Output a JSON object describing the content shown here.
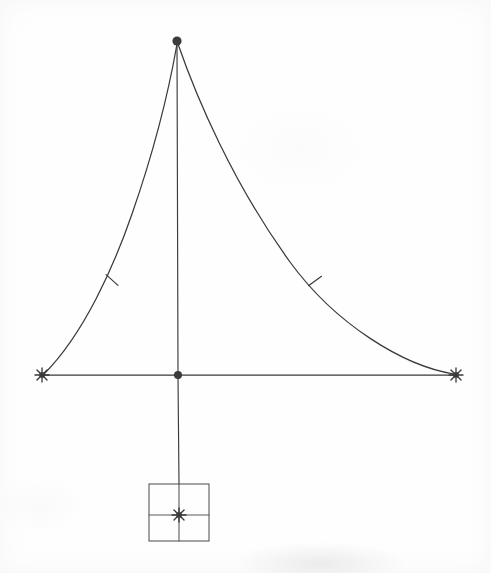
{
  "figure": {
    "background_color": "#fefefe",
    "ink_color": "#3a3a3c",
    "ink_color_light": "#5a5a5e",
    "width": 491,
    "height": 573
  },
  "geometry": {
    "apex": {
      "label": "apex-node",
      "x": 177,
      "y": 41,
      "marker": "filled-dot",
      "radius": 4.6
    },
    "center": {
      "label": "center-node",
      "x": 178,
      "y": 375,
      "marker": "filled-dot",
      "radius": 4.0
    },
    "left_end": {
      "label": "left-endpoint",
      "x": 42,
      "y": 375,
      "marker": "star-cross"
    },
    "right_end": {
      "label": "right-endpoint",
      "x": 456,
      "y": 375,
      "marker": "star-cross"
    },
    "left_tick": {
      "label": "left-curve-tick",
      "x": 112,
      "y": 280,
      "angle_deg": 42
    },
    "right_tick": {
      "label": "right-curve-tick",
      "x": 315,
      "y": 281,
      "angle_deg": -36
    },
    "box_center_marker": {
      "label": "box-center-node",
      "x": 179,
      "y": 515,
      "marker": "star-cross"
    }
  },
  "paths": {
    "left_curve": {
      "name": "left-curve",
      "description": "concave arc from apex down-left to left endpoint",
      "d": "M 177 44 C 170 84, 155 148, 132 214 C 114 266, 84 334, 44 374"
    },
    "right_curve": {
      "name": "right-curve",
      "description": "convex decay arc from apex down-right to right endpoint",
      "d": "M 178 44 C 196 96, 232 182, 290 262 C 336 325, 404 366, 454 374"
    },
    "vertical_axis_upper": {
      "name": "vertical-axis-upper",
      "description": "mast line from apex to center node",
      "d": "M 177 45 L 178 373"
    },
    "vertical_axis_lower": {
      "name": "vertical-axis-lower",
      "description": "stem line from center node down to base square",
      "d": "M 178 377 L 179 484"
    },
    "baseline": {
      "name": "baseline",
      "description": "horizontal base spanning left to right endpoint through center",
      "d": "M 43 375 L 455 375"
    }
  },
  "base_square": {
    "name": "base-square",
    "x": 149,
    "y": 484,
    "width": 60,
    "height": 57,
    "vertical_divider_x": 179,
    "horizontal_divider_y": 515
  },
  "markers": {
    "star_cross_arm": 7,
    "tick_half_length": 8
  },
  "legend_labels": {
    "apex": "apex",
    "center": "center",
    "left_end": "left end",
    "right_end": "right end",
    "base": "base square"
  }
}
